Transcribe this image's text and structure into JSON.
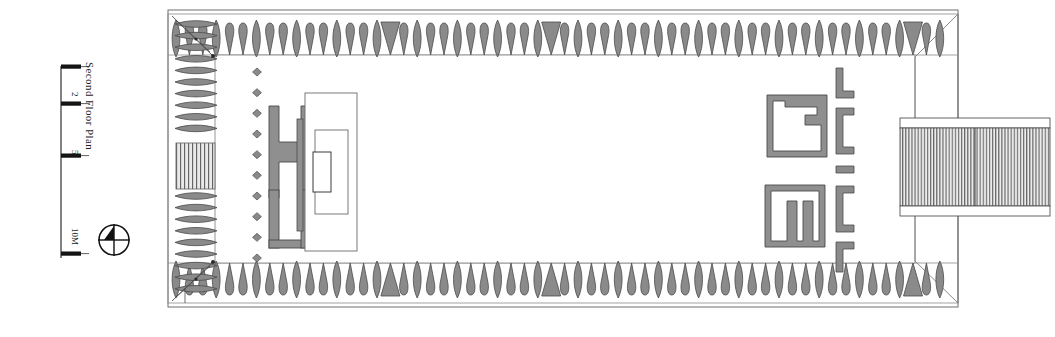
{
  "drawing": {
    "title": "Second Floor Plan",
    "type": "architectural-floor-plan",
    "orientation": "landscape",
    "background_color": "#ffffff",
    "line_color": "#1d1d1d",
    "fill_gray": "#8a8a8a",
    "fill_gray_light": "#9a9a9a",
    "hatch_color": "#6f6f6f"
  },
  "scale_bar": {
    "name": "graphic-scale-bar",
    "unit": "M",
    "ticks": [
      {
        "label": "",
        "value": 0
      },
      {
        "label": "2",
        "value": 2
      },
      {
        "label": "5",
        "value": 5
      },
      {
        "label": "10M",
        "value": 10
      }
    ]
  },
  "north_arrow": {
    "name": "north-arrow-compass",
    "style": "circle-with-crosshair",
    "label": ""
  },
  "plan": {
    "outer_wall": {
      "x": 168,
      "y": 10,
      "w": 790,
      "h": 297
    },
    "inner_court": {
      "x": 215,
      "y": 55,
      "w": 700,
      "h": 208
    },
    "colonnade_top": {
      "name": "peristyle-columns-top",
      "count": 58,
      "pattern": "alternating-lens-and-teardrop"
    },
    "colonnade_bottom": {
      "name": "peristyle-columns-bottom",
      "count": 58,
      "pattern": "alternating-lens-and-teardrop"
    },
    "colonnade_left": {
      "name": "peristyle-columns-left",
      "count": 22,
      "pattern": "stacked-lens"
    },
    "colonnade_right": {
      "name": "peristyle-columns-right",
      "count": 0,
      "pattern": "none"
    },
    "west_stair": {
      "name": "west-entrance-stair",
      "hatch": "vertical-treads",
      "treads": 12
    },
    "east_stair": {
      "name": "east-projecting-stair-block",
      "hatch": "vertical-treads",
      "treads": 34
    },
    "column_dots": {
      "name": "interior-column-markers",
      "count": 10,
      "shape": "diamond"
    },
    "shrine": {
      "name": "central-shrine-platform",
      "nested_rects": 3
    },
    "h_wall": {
      "name": "h-shaped-partition-wall"
    },
    "thin_wall": {
      "name": "thin-screen-wall"
    },
    "maze_upper": {
      "name": "upper-labyrinth-chamber"
    },
    "maze_lower": {
      "name": "lower-labyrinth-chamber"
    },
    "brackets": {
      "name": "east-wall-pilaster-brackets",
      "count": 6
    },
    "corner_diagonals": {
      "name": "corner-construction-diagonals",
      "count": 4
    }
  }
}
